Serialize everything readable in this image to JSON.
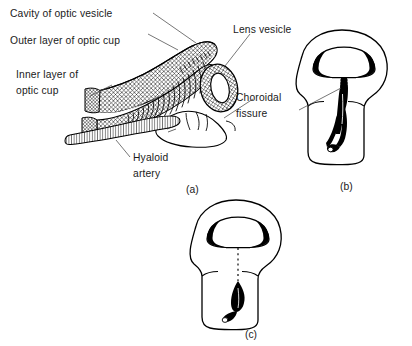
{
  "figure": {
    "background_color": "#ffffff",
    "ink_color": "#000000",
    "leader_color": "#4a4a4a"
  },
  "labels": {
    "cavity_of_optic_vesicle": "Cavity of optic vesicle",
    "outer_layer_of_optic_cup": "Outer layer of optic cup",
    "inner_layer_line1": "Inner layer of",
    "inner_layer_line2": "optic cup",
    "lens_vesicle": "Lens vesicle",
    "choroidal_line1": "Choroidal",
    "choroidal_line2": "fissure",
    "hyaloid_line1": "Hyaloid",
    "hyaloid_line2": "artery"
  },
  "captions": {
    "a": "(a)",
    "b": "(b)",
    "c": "(c)"
  },
  "panels": [
    {
      "id": "a",
      "name": "sagittal-section-optic-cup",
      "caption": "(a)",
      "description": "Sagittal section through optic cup and lens vesicle showing inner and outer layers, cavity of optic vesicle, and hyaloid artery in the choroidal fissure",
      "features": [
        "cavity of optic vesicle",
        "outer layer of optic cup",
        "inner layer of optic cup",
        "lens vesicle",
        "hyaloid artery"
      ]
    },
    {
      "id": "b",
      "name": "optic-cup-open-fissure",
      "caption": "(b)",
      "description": "Inferior view of optic cup and stalk with the choroidal fissure still open along the stalk",
      "features": [
        "choroidal fissure open",
        "hyaloid vessels"
      ]
    },
    {
      "id": "c",
      "name": "optic-cup-closed-fissure",
      "caption": "(c)",
      "description": "Inferior view of optic cup and stalk after the choroidal fissure has closed, shown by the dashed line",
      "features": [
        "choroidal fissure closed",
        "dashed closure line"
      ]
    }
  ]
}
